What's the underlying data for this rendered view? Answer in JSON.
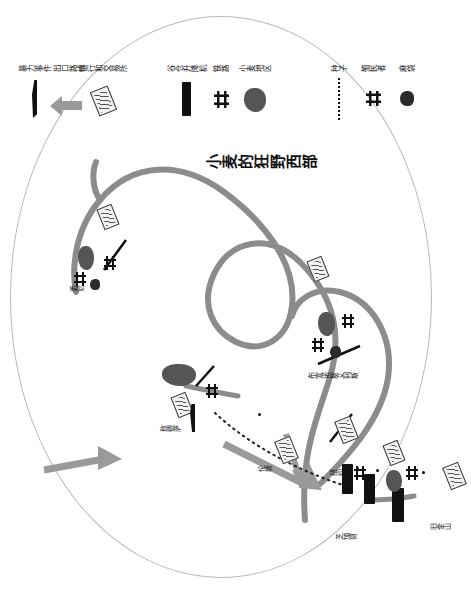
{
  "title": "小麦的狂野西部",
  "map": {
    "places": [
      {
        "name": "悉尼",
        "role": "bank-city"
      },
      {
        "name": "敖德萨",
        "role": "port-city"
      },
      {
        "name": "伦敦",
        "role": "bank-city"
      },
      {
        "name": "布宜诺斯艾利斯",
        "role": "port-city"
      },
      {
        "name": "纽约",
        "role": "bank-city"
      },
      {
        "name": "芝加哥",
        "role": "elevator-city"
      },
      {
        "name": "旧金山",
        "role": "port-city"
      }
    ]
  },
  "legend": {
    "columns": [
      {
        "id": "col-left",
        "items": [
          {
            "label": "种子",
            "icon": "dotted-line-icon"
          },
          {
            "label": "殖民者",
            "icon": "settler-icon"
          },
          {
            "label": "麻袋",
            "icon": "sack-icon"
          }
        ]
      },
      {
        "id": "col-middle",
        "items": [
          {
            "label": "谷仓升降机",
            "icon": "grain-elevator-icon"
          },
          {
            "label": "铁路",
            "icon": "railroad-icon"
          },
          {
            "label": "小麦地区",
            "icon": "wheat-region-icon"
          }
        ]
      },
      {
        "id": "col-right",
        "items": [
          {
            "label": "暴力事件",
            "icon": "rifle-icon"
          },
          {
            "label": "出口路线",
            "icon": "arrow-route-icon"
          },
          {
            "label": "银行和交易所",
            "icon": "bank-exchange-icon"
          }
        ]
      }
    ]
  },
  "colors": {
    "route": "#8c8c8c",
    "ink": "#111111",
    "frame": "#b9b9b9",
    "wheat": "#555555"
  }
}
